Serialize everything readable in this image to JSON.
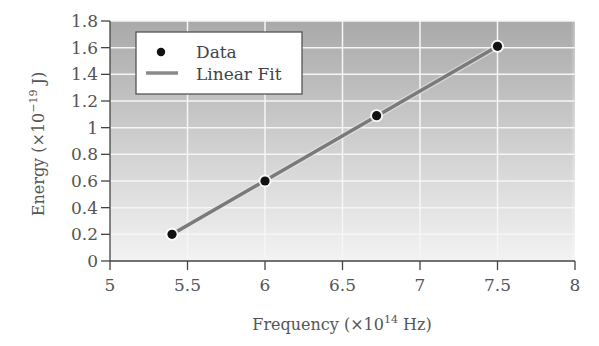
{
  "chart_data": {
    "type": "scatter",
    "title": "",
    "xlabel": "Frequency (×10^14 Hz)",
    "ylabel": "Energy (×10^-19 J)",
    "xlim": [
      5,
      8
    ],
    "ylim": [
      0,
      1.8
    ],
    "x_ticks": [
      "5",
      "5.5",
      "6",
      "6.5",
      "7",
      "7.5",
      "8"
    ],
    "y_ticks": [
      "0",
      "0.2",
      "0.4",
      "0.6",
      "0.8",
      "1",
      "1.2",
      "1.4",
      "1.6",
      "1.8"
    ],
    "grid": true,
    "legend_position": "upper left",
    "series": [
      {
        "name": "Data",
        "type": "scatter",
        "x": [
          5.4,
          6.0,
          6.72,
          7.5
        ],
        "y": [
          0.2,
          0.6,
          1.09,
          1.61
        ],
        "color": "#111111"
      },
      {
        "name": "Linear Fit",
        "type": "line",
        "x": [
          5.4,
          7.5
        ],
        "y": [
          0.2,
          1.61
        ],
        "color": "#7a7a7a"
      }
    ]
  },
  "axes": {
    "xlabel_main": "Frequency (×10",
    "xlabel_sup": "14",
    "xlabel_end": " Hz)",
    "ylabel_main": "Energy (×10",
    "ylabel_sup": "−19",
    "ylabel_end": " J)"
  },
  "legend": {
    "items": [
      {
        "label": "Data"
      },
      {
        "label": "Linear Fit"
      }
    ]
  },
  "colors": {
    "plot_bg_top": "#a9a9a9",
    "plot_bg_bottom": "#f3f3f3",
    "grid": "#f6f6f6",
    "fit_line": "#7a7a7a",
    "marker": "#111111",
    "axis": "#444444"
  }
}
